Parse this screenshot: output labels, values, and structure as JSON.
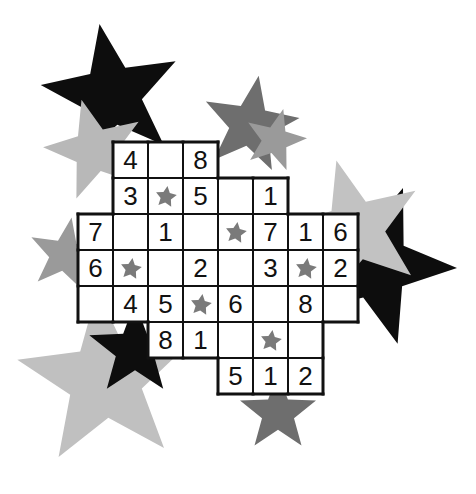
{
  "puzzle": {
    "type": "star-grid-number-puzzle",
    "cols": 8,
    "rows": 7,
    "origin": {
      "x": 78,
      "y": 142
    },
    "cell_w": 35,
    "cell_h": 36,
    "colors": {
      "star_cell": "#7a7a7a",
      "line": "#111111",
      "cell_bg": "#ffffff"
    },
    "cells": [
      {
        "r": 0,
        "c": 1,
        "v": "4"
      },
      {
        "r": 0,
        "c": 2,
        "v": ""
      },
      {
        "r": 0,
        "c": 3,
        "v": "8"
      },
      {
        "r": 1,
        "c": 1,
        "v": "3"
      },
      {
        "r": 1,
        "c": 2,
        "v": "star"
      },
      {
        "r": 1,
        "c": 3,
        "v": "5"
      },
      {
        "r": 1,
        "c": 4,
        "v": ""
      },
      {
        "r": 1,
        "c": 5,
        "v": "1"
      },
      {
        "r": 2,
        "c": 0,
        "v": "7"
      },
      {
        "r": 2,
        "c": 1,
        "v": ""
      },
      {
        "r": 2,
        "c": 2,
        "v": "1"
      },
      {
        "r": 2,
        "c": 3,
        "v": ""
      },
      {
        "r": 2,
        "c": 4,
        "v": "star"
      },
      {
        "r": 2,
        "c": 5,
        "v": "7"
      },
      {
        "r": 2,
        "c": 6,
        "v": "1"
      },
      {
        "r": 2,
        "c": 7,
        "v": "6"
      },
      {
        "r": 3,
        "c": 0,
        "v": "6"
      },
      {
        "r": 3,
        "c": 1,
        "v": "star"
      },
      {
        "r": 3,
        "c": 2,
        "v": ""
      },
      {
        "r": 3,
        "c": 3,
        "v": "2"
      },
      {
        "r": 3,
        "c": 4,
        "v": ""
      },
      {
        "r": 3,
        "c": 5,
        "v": "3"
      },
      {
        "r": 3,
        "c": 6,
        "v": "star"
      },
      {
        "r": 3,
        "c": 7,
        "v": "2"
      },
      {
        "r": 4,
        "c": 0,
        "v": ""
      },
      {
        "r": 4,
        "c": 1,
        "v": "4"
      },
      {
        "r": 4,
        "c": 2,
        "v": "5"
      },
      {
        "r": 4,
        "c": 3,
        "v": "star"
      },
      {
        "r": 4,
        "c": 4,
        "v": "6"
      },
      {
        "r": 4,
        "c": 5,
        "v": ""
      },
      {
        "r": 4,
        "c": 6,
        "v": "8"
      },
      {
        "r": 4,
        "c": 7,
        "v": ""
      },
      {
        "r": 5,
        "c": 2,
        "v": "8"
      },
      {
        "r": 5,
        "c": 3,
        "v": "1"
      },
      {
        "r": 5,
        "c": 4,
        "v": ""
      },
      {
        "r": 5,
        "c": 5,
        "v": "star"
      },
      {
        "r": 5,
        "c": 6,
        "v": ""
      },
      {
        "r": 6,
        "c": 4,
        "v": "5"
      },
      {
        "r": 6,
        "c": 5,
        "v": "1"
      },
      {
        "r": 6,
        "c": 6,
        "v": "2"
      }
    ]
  },
  "background_stars": [
    {
      "name": "black-star-top",
      "cx": 112,
      "cy": 95,
      "r": 72,
      "fill": "#0d0d0d",
      "rot": -10
    },
    {
      "name": "lightgray-star-topleft",
      "cx": 95,
      "cy": 150,
      "r": 52,
      "fill": "#b8b8b8",
      "rot": -15
    },
    {
      "name": "darkgray-star-top",
      "cx": 250,
      "cy": 125,
      "r": 50,
      "fill": "#6e6e6e",
      "rot": 10
    },
    {
      "name": "midgray-star-top-small",
      "cx": 275,
      "cy": 140,
      "r": 32,
      "fill": "#9a9a9a",
      "rot": 15
    },
    {
      "name": "black-star-right",
      "cx": 375,
      "cy": 265,
      "r": 82,
      "fill": "#0d0d0d",
      "rot": 20
    },
    {
      "name": "lightgray-star-right",
      "cx": 355,
      "cy": 230,
      "r": 72,
      "fill": "#c2c2c2",
      "rot": -15
    },
    {
      "name": "gray-star-left",
      "cx": 65,
      "cy": 255,
      "r": 38,
      "fill": "#9a9a9a",
      "rot": 10
    },
    {
      "name": "lightgray-star-bottomleft",
      "cx": 105,
      "cy": 380,
      "r": 90,
      "fill": "#c0c0c0",
      "rot": -5
    },
    {
      "name": "black-star-bottomleft",
      "cx": 135,
      "cy": 350,
      "r": 48,
      "fill": "#0d0d0d",
      "rot": 0
    },
    {
      "name": "darkgray-star-bottom",
      "cx": 278,
      "cy": 413,
      "r": 40,
      "fill": "#6e6e6e",
      "rot": 0
    }
  ]
}
